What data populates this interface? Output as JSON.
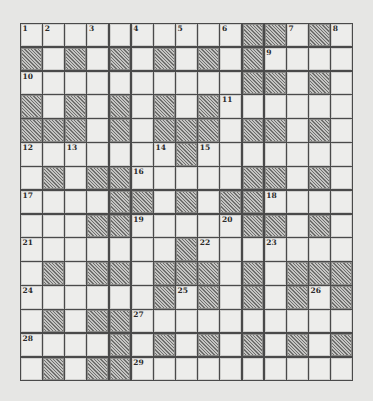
{
  "puzzle": {
    "rows": 15,
    "cols": 15,
    "colors": {
      "background": "#e6e6e4",
      "cell_white": "#ededeb",
      "cell_block": "#9a9a98",
      "grid_line": "#4a4a4a"
    },
    "layout": [
      "WWWWWWWWWWBBWBW",
      "BWBWBWBWBWBWWWW",
      "WWWWWWWWWWBBWBW",
      "BWBWBWBWBWWWWWW",
      "BBBWBWBBBWBBWBW",
      "WWWWWWWBWWWWWWW",
      "WBWBBWWWWWBBWBW",
      "WWWWBBWBWBBWWWW",
      "WWWBBWWWWWBBWBW",
      "WWWWWWWBWWWWWWW",
      "WBWBBWBBBWBWBBB",
      "WWWWWWBWBWBWBWB",
      "WBWBBWWWWWWWWWW",
      "WWWWBWBWBWBWBWB",
      "WBWBBWWWWWWWWWW"
    ],
    "numbers": [
      {
        "n": "1",
        "r": 0,
        "c": 0
      },
      {
        "n": "2",
        "r": 0,
        "c": 1
      },
      {
        "n": "3",
        "r": 0,
        "c": 3
      },
      {
        "n": "4",
        "r": 0,
        "c": 5
      },
      {
        "n": "5",
        "r": 0,
        "c": 7
      },
      {
        "n": "6",
        "r": 0,
        "c": 9
      },
      {
        "n": "7",
        "r": 0,
        "c": 12
      },
      {
        "n": "8",
        "r": 0,
        "c": 14
      },
      {
        "n": "9",
        "r": 1,
        "c": 11
      },
      {
        "n": "10",
        "r": 2,
        "c": 0
      },
      {
        "n": "11",
        "r": 3,
        "c": 9
      },
      {
        "n": "12",
        "r": 5,
        "c": 0
      },
      {
        "n": "13",
        "r": 5,
        "c": 2
      },
      {
        "n": "14",
        "r": 5,
        "c": 6
      },
      {
        "n": "15",
        "r": 5,
        "c": 8
      },
      {
        "n": "16",
        "r": 6,
        "c": 5
      },
      {
        "n": "17",
        "r": 7,
        "c": 0
      },
      {
        "n": "18",
        "r": 7,
        "c": 11
      },
      {
        "n": "19",
        "r": 8,
        "c": 5
      },
      {
        "n": "20",
        "r": 8,
        "c": 9
      },
      {
        "n": "21",
        "r": 9,
        "c": 0
      },
      {
        "n": "22",
        "r": 9,
        "c": 8
      },
      {
        "n": "23",
        "r": 9,
        "c": 11
      },
      {
        "n": "24",
        "r": 11,
        "c": 0
      },
      {
        "n": "25",
        "r": 11,
        "c": 7
      },
      {
        "n": "26",
        "r": 11,
        "c": 13
      },
      {
        "n": "27",
        "r": 12,
        "c": 5
      },
      {
        "n": "28",
        "r": 13,
        "c": 0
      },
      {
        "n": "29",
        "r": 14,
        "c": 5
      }
    ]
  }
}
